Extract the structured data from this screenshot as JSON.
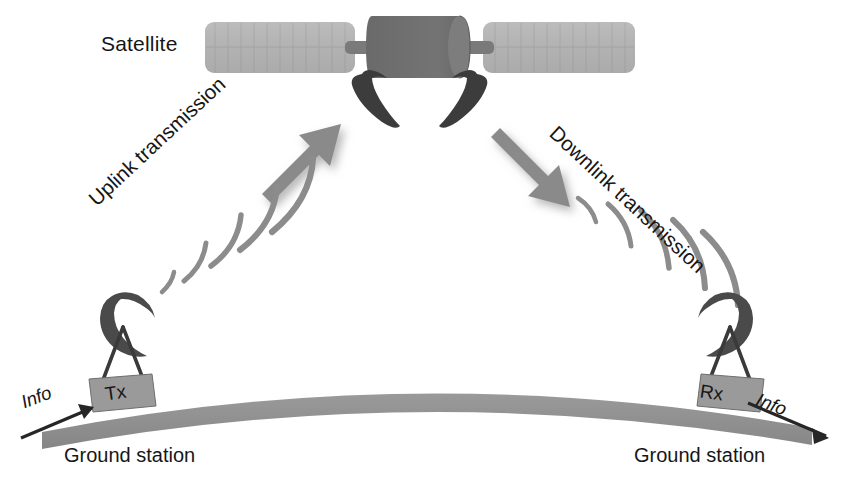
{
  "diagram": {
    "background_color": "#ffffff"
  },
  "labels": {
    "satellite": "Satellite",
    "uplink": "Uplink transmission",
    "downlink": "Downlink transmission",
    "ground_station_left": "Ground station",
    "ground_station_right": "Ground station",
    "info_left": "Info",
    "info_right": "Info",
    "tx": "Tx",
    "rx": "Rx"
  },
  "colors": {
    "solar_panel": "#b4b4b4",
    "satellite_body": "#6e6e6e",
    "satellite_body_cap": "#828282",
    "satellite_antenna": "#3c3c3c",
    "earth_surface": "#8f8f8f",
    "station_box": "#9a9a9a",
    "station_mast": "#3a3a3a",
    "dish": "#4a4a4a",
    "signal_wave": "#8c8c8c",
    "big_arrow": "#8a8a8a",
    "big_arrow_shadow": "#c9c9c9",
    "info_arrow": "#262626",
    "text": "#161616"
  },
  "icons": {
    "satellite_solar_panel_left": "solar-panel-icon",
    "satellite_solar_panel_right": "solar-panel-icon",
    "satellite_body": "satellite-body-icon",
    "satellite_antenna_left": "satellite-dish-icon",
    "satellite_antenna_right": "satellite-dish-icon",
    "uplink_arrow": "arrow-up-right-icon",
    "downlink_arrow": "arrow-down-right-icon",
    "uplink_waves": "signal-waves-icon",
    "downlink_waves": "signal-waves-icon",
    "ground_dish_left": "ground-dish-icon",
    "ground_dish_right": "ground-dish-icon",
    "earth": "earth-surface-icon",
    "info_arrow_left": "arrow-right-icon",
    "info_arrow_right": "arrow-right-icon"
  },
  "elements": {
    "uplink_direction": "ground-to-satellite",
    "downlink_direction": "satellite-to-ground",
    "left_station_role": "transmitter",
    "right_station_role": "receiver"
  }
}
